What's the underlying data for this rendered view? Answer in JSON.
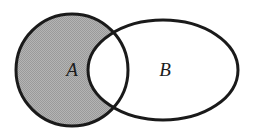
{
  "figure": {
    "name": "venn-diagram-set-difference",
    "background_color": "#ffffff",
    "stroke_color": "#1a1a1a",
    "stroke_width": 3,
    "shaded_fill_color": "#a8a8a8",
    "unshaded_fill_color": "#ffffff",
    "shaded_region_description": "A minus B"
  },
  "sets": [
    {
      "id": "A",
      "label": "A",
      "shape": "circle",
      "shaded": true,
      "cx": 72,
      "cy": 70,
      "rx": 56,
      "ry": 56,
      "label_x": 72,
      "label_y": 72
    },
    {
      "id": "B",
      "label": "B",
      "shape": "ellipse",
      "shaded": false,
      "cx": 163,
      "cy": 70,
      "rx": 75,
      "ry": 50,
      "label_x": 165,
      "label_y": 72
    }
  ]
}
